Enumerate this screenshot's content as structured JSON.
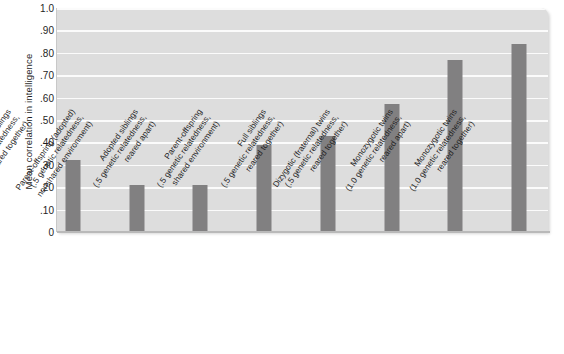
{
  "chart_data": {
    "type": "bar",
    "title": "",
    "xlabel": "",
    "ylabel": "Mean correlation in intelligence",
    "ylim": [
      0,
      1.0
    ],
    "grid": true,
    "legend": "none",
    "bar_color": "#818081",
    "plot_background": "#dddddd",
    "gridline_color": "#fbfbfb",
    "y_ticks": [
      "0",
      ".10",
      ".20",
      ".30",
      ".40",
      ".50",
      ".60",
      ".70",
      ".80",
      ".90",
      "1.0"
    ],
    "y_tick_values": [
      0,
      0.1,
      0.2,
      0.3,
      0.4,
      0.5,
      0.6,
      0.7,
      0.8,
      0.9,
      1.0
    ],
    "categories": [
      "Adoptive siblings (0 genetic relatedness, reared together)",
      "Parent-offspring (adopted) (.5 genetic relatedness, nonshared environment)",
      "Adopted siblings (.5 genetic relatedness, reared apart)",
      "Parent-offspring (.5 genetic relatedness, shared environment)",
      "Full siblings (.5 genetic relatedness, reared together)",
      "Dizygotic (fraternal) twins (.5 genetic relatedness, reared together)",
      "Monozygotic twins (1.0 genetic relatedness, reared apart)",
      "Monozygotic twins (1.0 genetic relatedness, reared together)"
    ],
    "category_lines": [
      [
        "Adoptive siblings",
        "(0 genetic relatedness,",
        "reared together)"
      ],
      [
        "Parent-offspring (adopted)",
        "(.5 genetic relatedness,",
        "nonshared environment)"
      ],
      [
        "Adopted siblings",
        "(.5 genetic relatedness,",
        "reared apart)"
      ],
      [
        "Parent-offspring",
        "(.5 genetic relatedness,",
        "shared environment)"
      ],
      [
        "Full siblings",
        "(.5 genetic relatedness,",
        "reared together)"
      ],
      [
        "Dizygotic (fraternal) twins",
        "(.5 genetic relatedness,",
        "reared together)"
      ],
      [
        "Monozygotic twins",
        "(1.0 genetic relatedness,",
        "reared apart)"
      ],
      [
        "Monozygotic twins",
        "(1.0 genetic relatedness,",
        "reared together)"
      ]
    ],
    "values": [
      0.32,
      0.21,
      0.21,
      0.39,
      0.43,
      0.57,
      0.77,
      0.84
    ]
  }
}
